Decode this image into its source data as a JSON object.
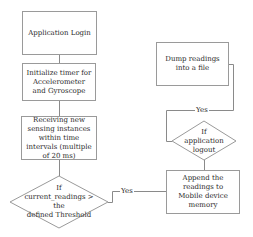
{
  "diagram": {
    "type": "flowchart",
    "nodes": [
      {
        "id": "login",
        "shape": "rect",
        "label": "Application Login"
      },
      {
        "id": "timer",
        "shape": "rect",
        "label": "Initialize timer for Accelerometer and Gyroscope"
      },
      {
        "id": "receive",
        "shape": "rect",
        "label": "Receiving new sensing instances within time intervals (multiple of 20 ms)"
      },
      {
        "id": "threshold",
        "shape": "diamond",
        "label_line1": "If",
        "label_line2": "current_readings > the",
        "label_line3": "defined Threshold"
      },
      {
        "id": "append",
        "shape": "rect",
        "label": "Append the readings to Mobile device memory"
      },
      {
        "id": "logout",
        "shape": "diamond",
        "label": "If application logout"
      },
      {
        "id": "dump",
        "shape": "rect",
        "label": "Dump readings into a file"
      }
    ],
    "edges": [
      {
        "from": "login",
        "to": "timer",
        "label": ""
      },
      {
        "from": "timer",
        "to": "receive",
        "label": ""
      },
      {
        "from": "receive",
        "to": "threshold",
        "label": ""
      },
      {
        "from": "threshold",
        "to": "append",
        "label": "Yes"
      },
      {
        "from": "append",
        "to": "logout",
        "label": ""
      },
      {
        "from": "logout",
        "to": "dump",
        "label": "Yes"
      }
    ],
    "colors": {
      "stroke": "#9a9a9a",
      "text": "#2b2b2b",
      "background": "#ffffff"
    }
  }
}
